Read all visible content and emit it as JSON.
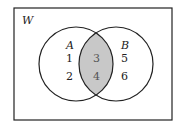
{
  "diagram": {
    "type": "venn",
    "universe_label": "W",
    "sets": [
      {
        "label": "A",
        "only_elements": [
          "1",
          "2"
        ]
      },
      {
        "label": "B",
        "only_elements": [
          "5",
          "6"
        ]
      }
    ],
    "intersection": {
      "elements": [
        "3",
        "4"
      ],
      "shaded": true
    },
    "colors": {
      "shade": "#c8c8c8",
      "stroke": "#222222"
    }
  }
}
